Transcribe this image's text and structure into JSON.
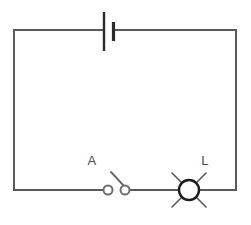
{
  "diagram": {
    "type": "circuit-schematic",
    "background_color": "#ffffff",
    "wire_color": "#5a5a5a",
    "ink_color": "#1c1c1c"
  },
  "labels": {
    "switch": "A",
    "lamp": "L"
  },
  "components": {
    "battery": {
      "name": "battery",
      "icon": "battery-cell-icon",
      "position": "top-edge",
      "long_plate_x": 104,
      "short_plate_x": 113
    },
    "switch": {
      "name": "switch",
      "icon": "open-switch-icon",
      "state": "open",
      "position": "bottom-left",
      "left_terminal_x": 108,
      "right_terminal_x": 125,
      "terminal_y": 190,
      "terminal_radius": 4.5
    },
    "lamp": {
      "name": "lamp",
      "icon": "lamp-bulb-icon",
      "position": "bottom-right",
      "center_x": 189,
      "center_y": 190,
      "radius": 10,
      "ray_count": 4
    }
  },
  "loop": {
    "left_x": 14,
    "right_x": 236,
    "top_y": 30,
    "bottom_y": 190
  }
}
